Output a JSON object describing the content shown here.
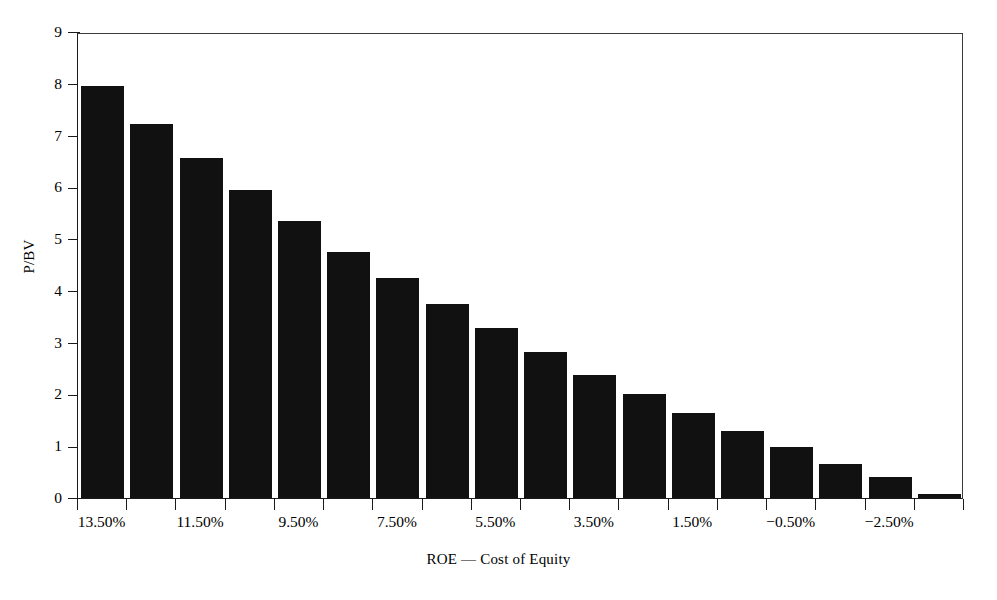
{
  "chart_data": {
    "type": "bar",
    "title": "",
    "xlabel": "ROE — Cost of Equity",
    "ylabel": "P/BV",
    "ylim": [
      0,
      9
    ],
    "yticks": [
      0,
      1,
      2,
      3,
      4,
      5,
      6,
      7,
      8,
      9
    ],
    "ytick_labels": [
      "0",
      "1",
      "2",
      "3",
      "4",
      "5",
      "6",
      "7",
      "8",
      "9"
    ],
    "grid": false,
    "legend": null,
    "bar_color": "#111111",
    "axis_color": "#1a1a1a",
    "background": "#ffffff",
    "categories": [
      "13.50%",
      "12.50%",
      "11.50%",
      "10.50%",
      "9.50%",
      "8.50%",
      "7.50%",
      "6.50%",
      "5.50%",
      "4.50%",
      "3.50%",
      "2.50%",
      "1.50%",
      "0.50%",
      "-0.50%",
      "-1.50%",
      "-2.50%",
      "-3.50%"
    ],
    "visible_xtick_labels": [
      "13.50%",
      "11.50%",
      "9.50%",
      "7.50%",
      "5.50%",
      "3.50%",
      "1.50%",
      "−0.50%",
      "−2.50%"
    ],
    "visible_xtick_indices": [
      0,
      2,
      4,
      6,
      8,
      10,
      12,
      14,
      16
    ],
    "values": [
      7.95,
      7.22,
      6.57,
      5.94,
      5.35,
      4.76,
      4.25,
      3.75,
      3.28,
      2.82,
      2.38,
      2.0,
      1.64,
      1.29,
      0.98,
      0.66,
      0.4,
      0.08
    ]
  }
}
